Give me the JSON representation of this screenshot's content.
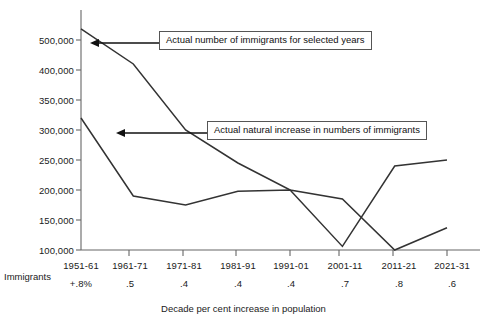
{
  "chart_data": {
    "type": "line",
    "title": "",
    "subtitle": "",
    "xlabel": "Decade per cent increase in population",
    "ylabel": "",
    "grid": false,
    "legend_position": "annotations-inline",
    "row_label": "Immigrants",
    "yticks": [
      500000,
      400000,
      350000,
      300000,
      250000,
      200000,
      150000,
      100000
    ],
    "ytick_labels": [
      "500,000",
      "400,000",
      "350,000",
      "300,000",
      "250,000",
      "200,000",
      "150,000",
      "100,000"
    ],
    "ylim": [
      100000,
      540000
    ],
    "categories": [
      "1951-61",
      "1961-71",
      "1971-81",
      "1981-91",
      "1991-01",
      "2001-11",
      "2011-21",
      "2021-31"
    ],
    "secondary_axis_labels": [
      "+.8%",
      ".5",
      ".4",
      ".4",
      ".4",
      ".7",
      ".8",
      ".6"
    ],
    "series": [
      {
        "name": "Actual number of immigrants for selected years",
        "values": [
          537000,
          420000,
          300000,
          245000,
          200000,
          185000,
          100000,
          137000
        ]
      },
      {
        "name": "Actual natural increase in numbers of immigrants",
        "values": [
          320000,
          190000,
          175000,
          198000,
          200000,
          106000,
          240000,
          250000
        ]
      }
    ],
    "annotations": [
      {
        "name": "immigrants-callout",
        "text": "Actual number of immigrants for selected years",
        "points_to": "1951-61 segment of upper line"
      },
      {
        "name": "natural-increase-callout",
        "text": "Actual natural increase in numbers of immigrants",
        "points_to": "1951-61 segment of lower line"
      }
    ],
    "colors": {
      "line": "#333333",
      "axis": "#666666",
      "text": "#1a1a1a",
      "callout_border": "#555555",
      "background": "#ffffff"
    }
  }
}
